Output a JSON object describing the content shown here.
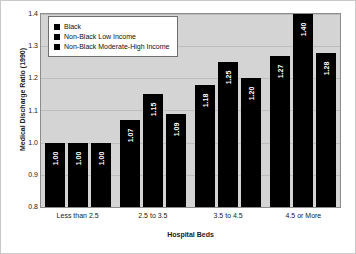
{
  "chart_data": {
    "type": "bar",
    "title": "",
    "xlabel": "Hospital Beds",
    "ylabel": "Medical Discharge Ratio (1990)",
    "ylim": [
      0.8,
      1.4
    ],
    "yticks": [
      "0.8",
      "0.9",
      "1.0",
      "1.1",
      "1.2",
      "1.3",
      "1.4"
    ],
    "grid": true,
    "legend_position": "top-left",
    "categories": [
      "Less than 2.5",
      "2.5 to 3.5",
      "3.5 to 4.5",
      "4.5 or More"
    ],
    "series": [
      {
        "name": "Black",
        "color": "#000000",
        "values": [
          1.0,
          1.07,
          1.18,
          1.27
        ],
        "labels": [
          "1.00",
          "1.07",
          "1.18",
          "1.27"
        ]
      },
      {
        "name": "Non-Black Low Income",
        "color": "#000000",
        "values": [
          1.0,
          1.15,
          1.25,
          1.4
        ],
        "labels": [
          "1.00",
          "1.15",
          "1.25",
          "1.40"
        ]
      },
      {
        "name": "Non-Black Moderate-High Income",
        "color": "#000000",
        "values": [
          1.0,
          1.09,
          1.2,
          1.28
        ],
        "labels": [
          "1.00",
          "1.09",
          "1.20",
          "1.28"
        ]
      }
    ]
  },
  "colors": {
    "bar": "#000000",
    "plot_background": "#d4d4d4",
    "figure_background": "#ffffff",
    "gridline": "#bdbdbd",
    "axis": "#8c8c8c",
    "value_label": "#ffffff"
  }
}
